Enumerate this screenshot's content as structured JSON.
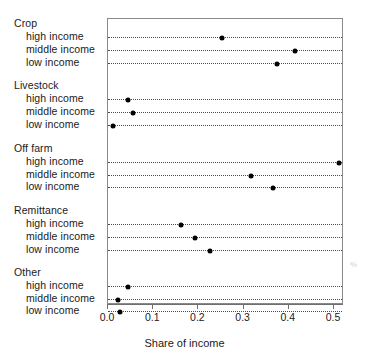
{
  "chart_data": {
    "type": "scatter",
    "title": "",
    "subtitle": "",
    "xlabel": "Share of income",
    "ylabel": "",
    "xlim": [
      0.0,
      0.5
    ],
    "xticks": [
      0.0,
      0.1,
      0.2,
      0.3,
      0.4,
      0.5
    ],
    "xticklabels": [
      "0.0",
      "0.1",
      "0.2",
      "0.3",
      "0.4",
      "0.5"
    ],
    "grid": "horizontal-dotted",
    "legend": "none",
    "groups": [
      {
        "name": "Crop",
        "points": [
          {
            "label": "high income",
            "value": 0.252
          },
          {
            "label": "middle income",
            "value": 0.414
          },
          {
            "label": "low income",
            "value": 0.373
          }
        ]
      },
      {
        "name": "Livestock",
        "points": [
          {
            "label": "high income",
            "value": 0.044
          },
          {
            "label": "middle income",
            "value": 0.055
          },
          {
            "label": "low income",
            "value": 0.012
          }
        ]
      },
      {
        "name": "Off farm",
        "points": [
          {
            "label": "high income",
            "value": 0.51
          },
          {
            "label": "middle income",
            "value": 0.317
          },
          {
            "label": "low income",
            "value": 0.366
          }
        ]
      },
      {
        "name": "Remittance",
        "points": [
          {
            "label": "high income",
            "value": 0.161
          },
          {
            "label": "middle income",
            "value": 0.192
          },
          {
            "label": "low income",
            "value": 0.226
          }
        ]
      },
      {
        "name": "Other",
        "points": [
          {
            "label": "high income",
            "value": 0.044
          },
          {
            "label": "middle income",
            "value": 0.022
          },
          {
            "label": "low income",
            "value": 0.027
          }
        ]
      }
    ],
    "marker": {
      "shape": "circle",
      "color": "#000000",
      "size": 5
    }
  },
  "artifact": {
    "text": "℁"
  }
}
